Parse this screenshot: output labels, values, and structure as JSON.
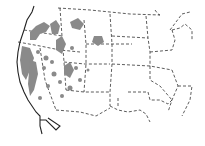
{
  "map": {
    "type": "range-map",
    "region": "Western and central United States",
    "colors": {
      "background": "#ffffff",
      "range_fill": "#8a8a8a",
      "border_line": "#333333",
      "coastline": "#222222"
    },
    "legend": null,
    "labels": []
  }
}
